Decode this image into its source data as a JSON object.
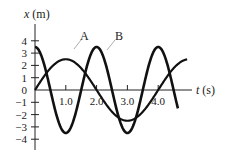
{
  "chart_data": {
    "type": "line",
    "title": "",
    "xlabel": "t (s)",
    "ylabel": "x (m)",
    "x_ticks": [
      "1.0",
      "2.0",
      "3.0",
      "4.0"
    ],
    "y_ticks": [
      "4",
      "3",
      "2",
      "1",
      "0",
      "−1",
      "−2",
      "−3",
      "−4"
    ],
    "xlim": [
      0,
      5.0
    ],
    "ylim": [
      -4.5,
      4.5
    ],
    "grid": false,
    "series": [
      {
        "name": "A",
        "description": "x = 2.5 sin(πt/2)",
        "amplitude": 2.5,
        "period": 4.0,
        "x": [
          0,
          0.5,
          1.0,
          1.5,
          2.0,
          2.5,
          3.0,
          3.5,
          4.0,
          4.5,
          5.0
        ],
        "values": [
          0,
          1.77,
          2.5,
          1.77,
          0,
          -1.77,
          -2.5,
          -1.77,
          0,
          1.77,
          2.5
        ]
      },
      {
        "name": "B",
        "description": "x = 3.5 cos(πt)",
        "amplitude": 3.5,
        "period": 2.0,
        "x": [
          0,
          0.5,
          1.0,
          1.5,
          2.0,
          2.5,
          3.0,
          3.5,
          4.0,
          4.5,
          5.0
        ],
        "values": [
          3.5,
          0,
          -3.5,
          0,
          3.5,
          0,
          -3.5,
          0,
          3.5,
          0,
          -3.5
        ]
      }
    ],
    "annotations": [
      {
        "text": "A"
      },
      {
        "text": "B"
      }
    ]
  }
}
